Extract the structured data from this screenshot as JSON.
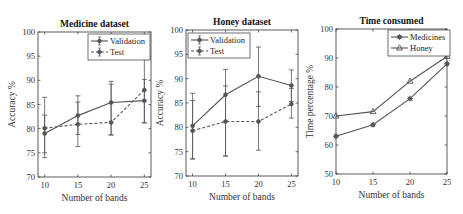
{
  "chart_data": [
    {
      "type": "line",
      "title": "Medicine dataset",
      "xlabel": "Number of bands",
      "ylabel": "Accuracy %",
      "x": [
        10,
        15,
        20,
        25
      ],
      "xticks": [
        "10",
        "15",
        "20",
        "25"
      ],
      "yticks": [
        "70",
        "75",
        "80",
        "85",
        "90",
        "95",
        "100"
      ],
      "ylim": [
        70,
        100
      ],
      "xlim": [
        9,
        26
      ],
      "legend_position": "upper right",
      "series": [
        {
          "name": "Validation",
          "style": "solid",
          "marker": "circle",
          "values": [
            79.0,
            82.7,
            85.4,
            85.8
          ],
          "err_low": [
            74.0,
            78.8,
            78.7,
            81.2
          ],
          "err_high": [
            86.5,
            86.8,
            89.8,
            90.2
          ]
        },
        {
          "name": "Test",
          "style": "dashed",
          "marker": "circle",
          "values": [
            80.1,
            80.9,
            81.3,
            88.0
          ],
          "err_low": [
            75.0,
            76.3,
            78.7,
            81.2
          ],
          "err_high": [
            82.8,
            85.5,
            89.2,
            94.6
          ]
        }
      ]
    },
    {
      "type": "line",
      "title": "Honey dataset",
      "xlabel": "Number of bands",
      "ylabel": "Accuracy %",
      "x": [
        10,
        15,
        20,
        25
      ],
      "xticks": [
        "10",
        "15",
        "20",
        "25"
      ],
      "yticks": [
        "70",
        "75",
        "80",
        "85",
        "90",
        "95",
        "100"
      ],
      "ylim": [
        70,
        100
      ],
      "xlim": [
        9,
        26
      ],
      "legend_position": "upper left",
      "series": [
        {
          "name": "Validation",
          "style": "solid",
          "marker": "circle",
          "values": [
            80.3,
            86.7,
            90.5,
            88.6
          ],
          "err_low": [
            73.5,
            74.1,
            84.3,
            85.3
          ],
          "err_high": [
            87.0,
            91.9,
            96.5,
            91.8
          ]
        },
        {
          "name": "Test",
          "style": "dashed",
          "marker": "circle",
          "values": [
            79.3,
            81.2,
            81.2,
            84.8
          ],
          "err_low": [
            73.5,
            74.1,
            75.3,
            81.9
          ],
          "err_high": [
            85.5,
            88.5,
            87.3,
            88.0
          ]
        }
      ]
    },
    {
      "type": "line",
      "title": "Time consumed",
      "xlabel": "Number of bands",
      "ylabel": "Time percentage %",
      "x": [
        10,
        15,
        20,
        25
      ],
      "xticks": [
        "10",
        "15",
        "20",
        "25"
      ],
      "yticks": [
        "50",
        "60",
        "70",
        "80",
        "90",
        "100"
      ],
      "ylim": [
        50,
        100
      ],
      "xlim": [
        10,
        25
      ],
      "legend_position": "upper right",
      "series": [
        {
          "name": "Medicines",
          "style": "solid",
          "marker": "asterisk",
          "values": [
            63.0,
            67.0,
            76.0,
            88.0
          ]
        },
        {
          "name": "Honey",
          "style": "solid",
          "marker": "triangle",
          "values": [
            70.0,
            71.5,
            82.0,
            90.5
          ]
        }
      ]
    }
  ],
  "colors": {
    "line": "#555555",
    "axis": "#333333",
    "background": "#ffffff"
  }
}
